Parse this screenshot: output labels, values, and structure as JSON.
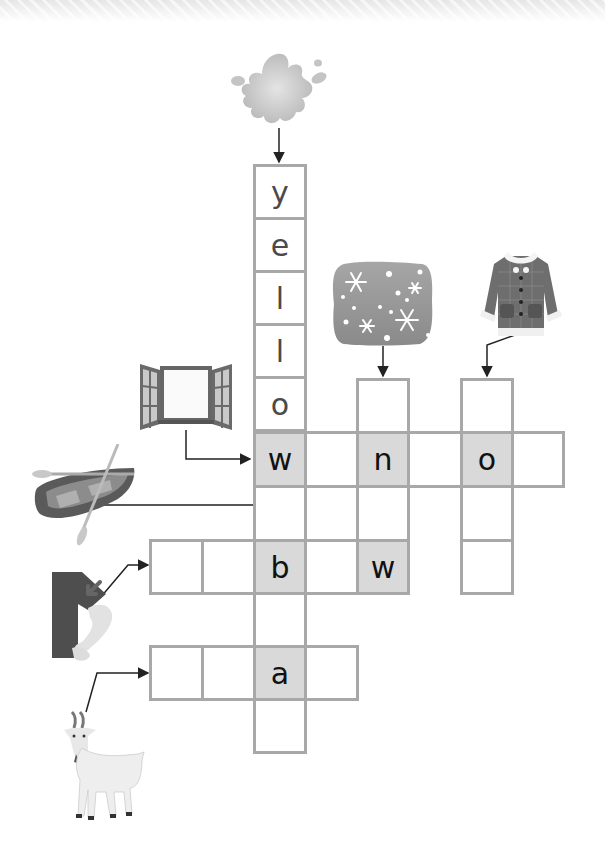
{
  "puzzle": {
    "type": "picture crossword",
    "words": [
      {
        "clue_image": "paint-splash-icon",
        "direction": "down",
        "answer_hint": "yellow",
        "letters": [
          "y",
          "e",
          "l",
          "l",
          "o",
          "w"
        ]
      },
      {
        "clue_image": "window-icon",
        "direction": "across",
        "letters": [
          "w",
          "",
          "n",
          "",
          "o",
          ""
        ]
      },
      {
        "clue_image": "snow-icon",
        "direction": "down",
        "letters": [
          "",
          "n",
          "",
          "w"
        ]
      },
      {
        "clue_image": "coat-icon",
        "direction": "down",
        "letters": [
          "",
          "o",
          "",
          ""
        ]
      },
      {
        "clue_image": "boat-icon",
        "direction": "down",
        "letters": [
          "w",
          "",
          "b",
          "",
          "a",
          ""
        ]
      },
      {
        "clue_image": "elbow-icon",
        "direction": "across",
        "letters": [
          "",
          "",
          "b",
          "",
          "w"
        ]
      },
      {
        "clue_image": "goat-icon",
        "direction": "across",
        "letters": [
          "",
          "",
          "a",
          ""
        ]
      }
    ]
  },
  "cells": {
    "c_y": "y",
    "c_e": "e",
    "c_l1": "l",
    "c_l2": "l",
    "c_o": "o",
    "c_w1": "w",
    "c_r1c2": "",
    "c_n": "n",
    "c_r1c4": "",
    "c_o2": "o",
    "c_r1c6": "",
    "c_snow_top": "",
    "c_coat_top": "",
    "c_r2c1": "",
    "c_r2c3": "",
    "c_r2c5": "",
    "c_b_l1": "",
    "c_b_l2": "",
    "c_b": "b",
    "c_r3c2": "",
    "c_w2": "w",
    "c_r3c5": "",
    "c_r4c1": "",
    "c_g1": "",
    "c_g2": "",
    "c_a": "a",
    "c_g4": "",
    "c_r6c1": ""
  },
  "colors": {
    "grid_border": "#a8a8a8",
    "shaded_cell": "#d9d9d9",
    "arrow": "#222222"
  }
}
